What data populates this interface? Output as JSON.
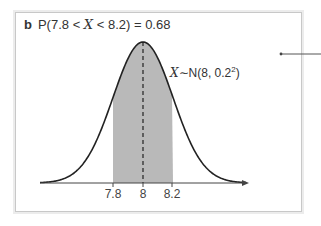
{
  "panel": {
    "tag": "b",
    "title_prefix": "P(7.8 < ",
    "title_var": "X",
    "title_suffix": " < 8.2) = 0.68"
  },
  "annotation": {
    "var": "X",
    "text": "∼N(8, 0.2",
    "sup": "2",
    "close": ")"
  },
  "ticks": [
    {
      "label": "7.8",
      "x": 113
    },
    {
      "label": "8",
      "x": 143
    },
    {
      "label": "8.2",
      "x": 172
    }
  ],
  "colors": {
    "shade": "#b9b9b9",
    "curve": "#222222",
    "axis": "#444444",
    "border": "#c8c8c8"
  },
  "chart_data": {
    "type": "area",
    "title": "P(7.8 < X < 8.2) = 0.68",
    "distribution": "Normal",
    "label": "X ~ N(8, 0.2^2)",
    "mean": 8,
    "sd": 0.2,
    "shaded_interval": [
      7.8,
      8.2
    ],
    "shaded_probability": 0.68,
    "x_tick_labels": [
      "7.8",
      "8",
      "8.2"
    ],
    "mean_line": "dashed vertical line at x = 8",
    "grid": false,
    "y_axis": "none"
  }
}
